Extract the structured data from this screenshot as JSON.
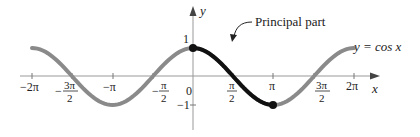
{
  "figure": {
    "function_label": "y = cos x",
    "annotation": "Principal part",
    "axis_x_label": "x",
    "axis_y_label": "y",
    "y_ticks": [
      {
        "value": 1,
        "label": "1"
      },
      {
        "value": -1,
        "label": "−1"
      }
    ],
    "x_ticks": [
      {
        "value": "-2π",
        "num": "−2π",
        "den": ""
      },
      {
        "value": "-3π/2",
        "num": "3π",
        "den": "2",
        "neg": true
      },
      {
        "value": "-π",
        "num": "−π",
        "den": ""
      },
      {
        "value": "-π/2",
        "num": "π",
        "den": "2",
        "neg": true
      },
      {
        "value": "0",
        "num": "0",
        "den": ""
      },
      {
        "value": "π/2",
        "num": "π",
        "den": "2"
      },
      {
        "value": "π",
        "num": "π",
        "den": ""
      },
      {
        "value": "3π/2",
        "num": "3π",
        "den": "2"
      },
      {
        "value": "2π",
        "num": "2π",
        "den": ""
      }
    ],
    "colors": {
      "curve": "#8a8a8a",
      "principal": "#111111",
      "axis": "#999999"
    }
  },
  "chart_data": {
    "type": "line",
    "title": "",
    "xlabel": "x",
    "ylabel": "y",
    "xlim": [
      "-2π",
      "2π"
    ],
    "ylim": [
      -1,
      1
    ],
    "series": [
      {
        "name": "y = cos x",
        "domain": [
          "-2π",
          "2π"
        ],
        "color": "#8a8a8a"
      },
      {
        "name": "Principal part",
        "domain": [
          "0",
          "π"
        ],
        "color": "#111111",
        "endpoints": [
          [
            0,
            1
          ],
          [
            "π",
            -1
          ]
        ]
      }
    ],
    "x_tick_labels": [
      "−2π",
      "−3π/2",
      "−π",
      "−π/2",
      "0",
      "π/2",
      "π",
      "3π/2",
      "2π"
    ],
    "y_tick_labels": [
      "1",
      "−1"
    ],
    "annotations": [
      "Principal part",
      "y = cos x"
    ],
    "grid": false
  }
}
